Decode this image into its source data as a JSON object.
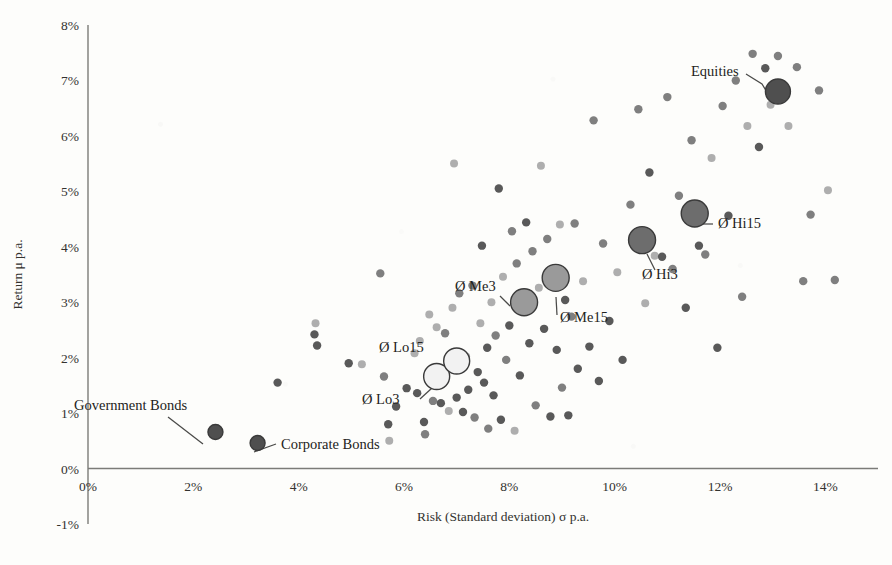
{
  "chart_data": {
    "type": "scatter",
    "title": "",
    "xlabel": "Risk (Standard deviation) σ p.a.",
    "ylabel": "Return μ p.a.",
    "xlim": [
      0,
      15
    ],
    "ylim": [
      -1,
      8
    ],
    "grid": false,
    "legend": "none",
    "xtick_labels": [
      "0%",
      "2%",
      "4%",
      "6%",
      "8%",
      "10%",
      "12%",
      "14%"
    ],
    "xtick_values": [
      0,
      2,
      4,
      6,
      8,
      10,
      12,
      14
    ],
    "ytick_labels": [
      "-1%",
      "0%",
      "1%",
      "2%",
      "3%",
      "4%",
      "5%",
      "6%",
      "7%",
      "8%"
    ],
    "ytick_values": [
      -1,
      0,
      1,
      2,
      3,
      4,
      5,
      6,
      7,
      8
    ],
    "origin_tick_label": "0%",
    "marker_colors": {
      "dark": "#595959",
      "medium": "#7f7f7f",
      "light": "#aeaeae",
      "highlight_dark": "#4f4f4f",
      "highlight_mid": "#808080",
      "highlight_light": "#f2f2f2",
      "outline": "#3a3a3a",
      "axis": "#7b7b78"
    },
    "series": [
      {
        "name": "Portfolio universe",
        "marker": "circle",
        "points": [
          {
            "x": 3.6,
            "y": 1.55,
            "shade": "dark",
            "r": 4.2
          },
          {
            "x": 4.3,
            "y": 2.42,
            "shade": "dark",
            "r": 4.2
          },
          {
            "x": 4.32,
            "y": 2.62,
            "shade": "light",
            "r": 4.0
          },
          {
            "x": 4.35,
            "y": 2.22,
            "shade": "dark",
            "r": 4.2
          },
          {
            "x": 4.95,
            "y": 1.9,
            "shade": "dark",
            "r": 4.2
          },
          {
            "x": 5.2,
            "y": 1.88,
            "shade": "light",
            "r": 4.0
          },
          {
            "x": 5.55,
            "y": 3.52,
            "shade": "medium",
            "r": 4.2
          },
          {
            "x": 5.62,
            "y": 1.66,
            "shade": "medium",
            "r": 4.2
          },
          {
            "x": 5.7,
            "y": 0.8,
            "shade": "dark",
            "r": 4.2
          },
          {
            "x": 5.72,
            "y": 0.5,
            "shade": "light",
            "r": 4.0
          },
          {
            "x": 5.85,
            "y": 1.12,
            "shade": "dark",
            "r": 4.2
          },
          {
            "x": 6.05,
            "y": 1.45,
            "shade": "dark",
            "r": 4.2
          },
          {
            "x": 6.2,
            "y": 2.08,
            "shade": "light",
            "r": 4.0
          },
          {
            "x": 6.25,
            "y": 1.36,
            "shade": "dark",
            "r": 4.2
          },
          {
            "x": 6.3,
            "y": 2.3,
            "shade": "light",
            "r": 4.0
          },
          {
            "x": 6.38,
            "y": 0.84,
            "shade": "dark",
            "r": 4.2
          },
          {
            "x": 6.4,
            "y": 0.62,
            "shade": "medium",
            "r": 4.2
          },
          {
            "x": 6.48,
            "y": 2.78,
            "shade": "light",
            "r": 4.0
          },
          {
            "x": 6.55,
            "y": 1.22,
            "shade": "medium",
            "r": 4.2
          },
          {
            "x": 6.62,
            "y": 2.55,
            "shade": "light",
            "r": 4.0
          },
          {
            "x": 6.7,
            "y": 1.18,
            "shade": "dark",
            "r": 4.2
          },
          {
            "x": 6.78,
            "y": 2.44,
            "shade": "medium",
            "r": 4.2
          },
          {
            "x": 6.85,
            "y": 1.04,
            "shade": "light",
            "r": 4.0
          },
          {
            "x": 6.92,
            "y": 2.9,
            "shade": "light",
            "r": 4.0
          },
          {
            "x": 7.0,
            "y": 1.28,
            "shade": "dark",
            "r": 4.2
          },
          {
            "x": 7.05,
            "y": 3.16,
            "shade": "medium",
            "r": 4.2
          },
          {
            "x": 7.12,
            "y": 1.02,
            "shade": "dark",
            "r": 4.2
          },
          {
            "x": 7.18,
            "y": 2.02,
            "shade": "light",
            "r": 4.0
          },
          {
            "x": 7.22,
            "y": 1.42,
            "shade": "dark",
            "r": 4.2
          },
          {
            "x": 7.3,
            "y": 3.3,
            "shade": "medium",
            "r": 4.2
          },
          {
            "x": 7.34,
            "y": 0.92,
            "shade": "medium",
            "r": 4.2
          },
          {
            "x": 7.4,
            "y": 1.74,
            "shade": "dark",
            "r": 4.2
          },
          {
            "x": 7.45,
            "y": 2.62,
            "shade": "light",
            "r": 4.0
          },
          {
            "x": 7.52,
            "y": 1.55,
            "shade": "dark",
            "r": 4.2
          },
          {
            "x": 7.58,
            "y": 2.18,
            "shade": "dark",
            "r": 4.2
          },
          {
            "x": 7.6,
            "y": 0.72,
            "shade": "medium",
            "r": 4.2
          },
          {
            "x": 7.66,
            "y": 3.0,
            "shade": "light",
            "r": 4.0
          },
          {
            "x": 7.7,
            "y": 1.32,
            "shade": "dark",
            "r": 4.2
          },
          {
            "x": 7.74,
            "y": 2.4,
            "shade": "medium",
            "r": 4.2
          },
          {
            "x": 7.8,
            "y": 5.05,
            "shade": "dark",
            "r": 4.2
          },
          {
            "x": 7.84,
            "y": 0.88,
            "shade": "dark",
            "r": 4.2
          },
          {
            "x": 7.88,
            "y": 3.46,
            "shade": "light",
            "r": 4.0
          },
          {
            "x": 7.94,
            "y": 1.96,
            "shade": "medium",
            "r": 4.2
          },
          {
            "x": 8.0,
            "y": 2.58,
            "shade": "dark",
            "r": 4.2
          },
          {
            "x": 8.05,
            "y": 4.28,
            "shade": "medium",
            "r": 4.2
          },
          {
            "x": 8.1,
            "y": 0.68,
            "shade": "light",
            "r": 4.0
          },
          {
            "x": 8.14,
            "y": 3.7,
            "shade": "medium",
            "r": 4.2
          },
          {
            "x": 8.2,
            "y": 1.68,
            "shade": "dark",
            "r": 4.2
          },
          {
            "x": 8.26,
            "y": 2.86,
            "shade": "light",
            "r": 4.0
          },
          {
            "x": 8.32,
            "y": 4.44,
            "shade": "dark",
            "r": 4.2
          },
          {
            "x": 8.38,
            "y": 2.26,
            "shade": "dark",
            "r": 4.2
          },
          {
            "x": 8.44,
            "y": 3.92,
            "shade": "medium",
            "r": 4.2
          },
          {
            "x": 8.5,
            "y": 1.14,
            "shade": "medium",
            "r": 4.2
          },
          {
            "x": 8.56,
            "y": 3.26,
            "shade": "light",
            "r": 4.0
          },
          {
            "x": 8.6,
            "y": 5.46,
            "shade": "light",
            "r": 4.0
          },
          {
            "x": 8.66,
            "y": 2.52,
            "shade": "dark",
            "r": 4.2
          },
          {
            "x": 8.72,
            "y": 4.14,
            "shade": "medium",
            "r": 4.2
          },
          {
            "x": 8.78,
            "y": 0.94,
            "shade": "dark",
            "r": 4.2
          },
          {
            "x": 8.84,
            "y": 3.6,
            "shade": "medium",
            "r": 4.2
          },
          {
            "x": 8.9,
            "y": 2.14,
            "shade": "dark",
            "r": 4.2
          },
          {
            "x": 8.96,
            "y": 4.4,
            "shade": "light",
            "r": 4.0
          },
          {
            "x": 9.0,
            "y": 1.46,
            "shade": "medium",
            "r": 4.2
          },
          {
            "x": 9.06,
            "y": 3.04,
            "shade": "dark",
            "r": 4.2
          },
          {
            "x": 9.12,
            "y": 0.96,
            "shade": "dark",
            "r": 4.2
          },
          {
            "x": 9.18,
            "y": 2.74,
            "shade": "medium",
            "r": 4.2
          },
          {
            "x": 9.24,
            "y": 4.42,
            "shade": "medium",
            "r": 4.2
          },
          {
            "x": 9.3,
            "y": 1.8,
            "shade": "dark",
            "r": 4.2
          },
          {
            "x": 9.4,
            "y": 3.38,
            "shade": "light",
            "r": 4.0
          },
          {
            "x": 9.52,
            "y": 2.2,
            "shade": "dark",
            "r": 4.2
          },
          {
            "x": 9.6,
            "y": 6.28,
            "shade": "medium",
            "r": 4.2
          },
          {
            "x": 9.7,
            "y": 1.58,
            "shade": "dark",
            "r": 4.2
          },
          {
            "x": 9.78,
            "y": 4.06,
            "shade": "medium",
            "r": 4.2
          },
          {
            "x": 9.9,
            "y": 2.66,
            "shade": "dark",
            "r": 4.2
          },
          {
            "x": 10.05,
            "y": 3.54,
            "shade": "light",
            "r": 4.0
          },
          {
            "x": 10.15,
            "y": 1.96,
            "shade": "dark",
            "r": 4.2
          },
          {
            "x": 10.3,
            "y": 4.76,
            "shade": "medium",
            "r": 4.2
          },
          {
            "x": 10.45,
            "y": 6.48,
            "shade": "medium",
            "r": 4.2
          },
          {
            "x": 10.58,
            "y": 2.98,
            "shade": "light",
            "r": 4.0
          },
          {
            "x": 10.66,
            "y": 5.34,
            "shade": "dark",
            "r": 4.2
          },
          {
            "x": 10.76,
            "y": 3.84,
            "shade": "light",
            "r": 4.0
          },
          {
            "x": 10.9,
            "y": 3.82,
            "shade": "dark",
            "r": 4.2
          },
          {
            "x": 11.0,
            "y": 6.7,
            "shade": "medium",
            "r": 4.2
          },
          {
            "x": 11.1,
            "y": 3.6,
            "shade": "medium",
            "r": 4.2
          },
          {
            "x": 11.22,
            "y": 4.92,
            "shade": "medium",
            "r": 4.2
          },
          {
            "x": 11.35,
            "y": 2.9,
            "shade": "dark",
            "r": 4.2
          },
          {
            "x": 11.46,
            "y": 5.92,
            "shade": "medium",
            "r": 4.2
          },
          {
            "x": 11.6,
            "y": 4.02,
            "shade": "dark",
            "r": 4.2
          },
          {
            "x": 11.72,
            "y": 3.86,
            "shade": "medium",
            "r": 4.2
          },
          {
            "x": 11.84,
            "y": 5.6,
            "shade": "light",
            "r": 4.0
          },
          {
            "x": 11.95,
            "y": 2.18,
            "shade": "dark",
            "r": 4.2
          },
          {
            "x": 12.05,
            "y": 6.54,
            "shade": "medium",
            "r": 4.2
          },
          {
            "x": 12.16,
            "y": 4.56,
            "shade": "dark",
            "r": 4.2
          },
          {
            "x": 12.3,
            "y": 7.0,
            "shade": "medium",
            "r": 4.2
          },
          {
            "x": 12.42,
            "y": 3.1,
            "shade": "medium",
            "r": 4.2
          },
          {
            "x": 12.52,
            "y": 6.18,
            "shade": "light",
            "r": 4.0
          },
          {
            "x": 12.62,
            "y": 7.48,
            "shade": "medium",
            "r": 4.2
          },
          {
            "x": 12.74,
            "y": 5.8,
            "shade": "dark",
            "r": 4.2
          },
          {
            "x": 12.86,
            "y": 7.22,
            "shade": "dark",
            "r": 4.2
          },
          {
            "x": 12.96,
            "y": 6.56,
            "shade": "light",
            "r": 4.0
          },
          {
            "x": 13.1,
            "y": 7.44,
            "shade": "medium",
            "r": 4.2
          },
          {
            "x": 13.3,
            "y": 6.18,
            "shade": "light",
            "r": 4.0
          },
          {
            "x": 13.46,
            "y": 7.24,
            "shade": "medium",
            "r": 4.2
          },
          {
            "x": 13.58,
            "y": 3.38,
            "shade": "medium",
            "r": 4.2
          },
          {
            "x": 13.72,
            "y": 4.58,
            "shade": "medium",
            "r": 4.2
          },
          {
            "x": 13.88,
            "y": 6.82,
            "shade": "medium",
            "r": 4.2
          },
          {
            "x": 14.05,
            "y": 5.02,
            "shade": "light",
            "r": 4.0
          },
          {
            "x": 14.18,
            "y": 3.4,
            "shade": "medium",
            "r": 4.2
          },
          {
            "x": 6.95,
            "y": 5.5,
            "shade": "light",
            "r": 4.0
          },
          {
            "x": 7.48,
            "y": 4.02,
            "shade": "dark",
            "r": 4.2
          }
        ]
      }
    ],
    "highlights": [
      {
        "id": "government-bonds",
        "label": "Government Bonds",
        "x": 2.42,
        "y": 0.66,
        "r": 7.5,
        "fill": "#4f4f4f",
        "stroke": "#3a3a3a",
        "label_x": 74,
        "label_y": 410,
        "anchor": "start",
        "leader": [
          [
            168,
            417
          ],
          [
            203,
            444
          ]
        ]
      },
      {
        "id": "corporate-bonds",
        "label": "Corporate Bonds",
        "x": 3.22,
        "y": 0.46,
        "r": 7.5,
        "fill": "#4f4f4f",
        "stroke": "#3a3a3a",
        "label_x": 281,
        "label_y": 449,
        "anchor": "start",
        "leader": [
          [
            276,
            444
          ],
          [
            254,
            452
          ]
        ]
      },
      {
        "id": "avg-lo3",
        "label": "Ø Lo3",
        "x": 6.62,
        "y": 1.66,
        "r": 13.0,
        "fill": "#f2f2f2",
        "stroke": "#3a3a3a",
        "label_x": 362,
        "label_y": 404,
        "anchor": "start",
        "leader": [
          [
            420,
            399
          ],
          [
            432,
            388
          ]
        ]
      },
      {
        "id": "avg-lo15",
        "label": "Ø Lo15",
        "x": 7.0,
        "y": 1.94,
        "r": 13.0,
        "fill": "#f2f2f2",
        "stroke": "#3a3a3a",
        "label_x": 379,
        "label_y": 352,
        "anchor": "start",
        "leader": [
          [
            447,
            352
          ],
          [
            464,
            365
          ]
        ]
      },
      {
        "id": "avg-me3",
        "label": "Ø Me3",
        "x": 8.28,
        "y": 3.0,
        "r": 13.5,
        "fill": "#9a9a9a",
        "stroke": "#3a3a3a",
        "label_x": 455,
        "label_y": 291,
        "anchor": "start",
        "leader": [
          [
            500,
            296
          ],
          [
            510,
            306
          ]
        ]
      },
      {
        "id": "avg-me15",
        "label": "Ø Me15",
        "x": 8.88,
        "y": 3.44,
        "r": 13.5,
        "fill": "#9a9a9a",
        "stroke": "#3a3a3a",
        "label_x": 560,
        "label_y": 322,
        "anchor": "start",
        "leader": [
          [
            557,
            315
          ],
          [
            556,
            297
          ]
        ]
      },
      {
        "id": "avg-hi3",
        "label": "Ø Hi3",
        "x": 10.52,
        "y": 4.12,
        "r": 13.5,
        "fill": "#6d6d6d",
        "stroke": "#3a3a3a",
        "label_x": 642,
        "label_y": 279,
        "anchor": "start",
        "leader": [
          [
            655,
            270
          ],
          [
            647,
            254
          ]
        ]
      },
      {
        "id": "avg-hi15",
        "label": "Ø Hi15",
        "x": 11.52,
        "y": 4.6,
        "r": 13.5,
        "fill": "#6d6d6d",
        "stroke": "#3a3a3a",
        "label_x": 718,
        "label_y": 228,
        "anchor": "start",
        "leader": [
          [
            713,
            224
          ],
          [
            700,
            224
          ]
        ]
      },
      {
        "id": "equities",
        "label": "Equities",
        "x": 13.1,
        "y": 6.8,
        "r": 12.5,
        "fill": "#4f4f4f",
        "stroke": "#3a3a3a",
        "label_x": 691,
        "label_y": 76,
        "anchor": "start",
        "leader": [
          [
            746,
            74
          ],
          [
            762,
            84
          ],
          [
            770,
            97
          ]
        ]
      }
    ]
  },
  "caption": {
    "text": ""
  }
}
